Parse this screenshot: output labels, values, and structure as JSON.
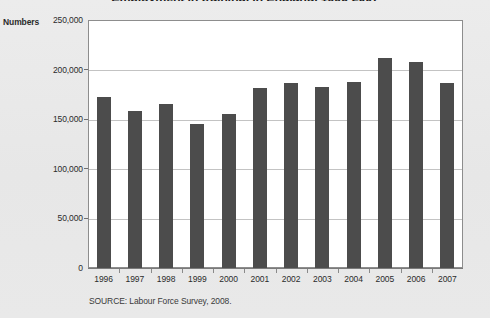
{
  "chart_data": {
    "type": "bar",
    "title": "Employment in training, in England, 1996-2007",
    "subtitle": "",
    "xlabel": "",
    "ylabel": "Numbers",
    "categories": [
      "1996",
      "1997",
      "1998",
      "1999",
      "2000",
      "2001",
      "2002",
      "2003",
      "2004",
      "2005",
      "2006",
      "2007"
    ],
    "values": [
      172000,
      158000,
      165000,
      145000,
      155000,
      181000,
      187000,
      182000,
      188000,
      212000,
      208000,
      187000
    ],
    "ylim": [
      0,
      250000
    ],
    "y_ticks": [
      0,
      50000,
      100000,
      150000,
      200000,
      250000
    ],
    "y_tick_labels": [
      "0",
      "50,000",
      "100,000",
      "150,000",
      "200,000",
      "250,000"
    ],
    "grid": true,
    "legend": false,
    "legend_position": "none",
    "bar_color": "#4c4c4c",
    "plot_background": "#ffffff",
    "page_background": "#e9e9e9",
    "gridline_color": "#c3c3c3",
    "source": "SOURCE: Labour Force Survey, 2008."
  },
  "axis": {
    "y_caption": "Numbers"
  },
  "footer": {
    "source": "SOURCE: Labour Force Survey, 2008."
  },
  "header": {
    "title": "Employment in training, in England, 1996-2007"
  }
}
